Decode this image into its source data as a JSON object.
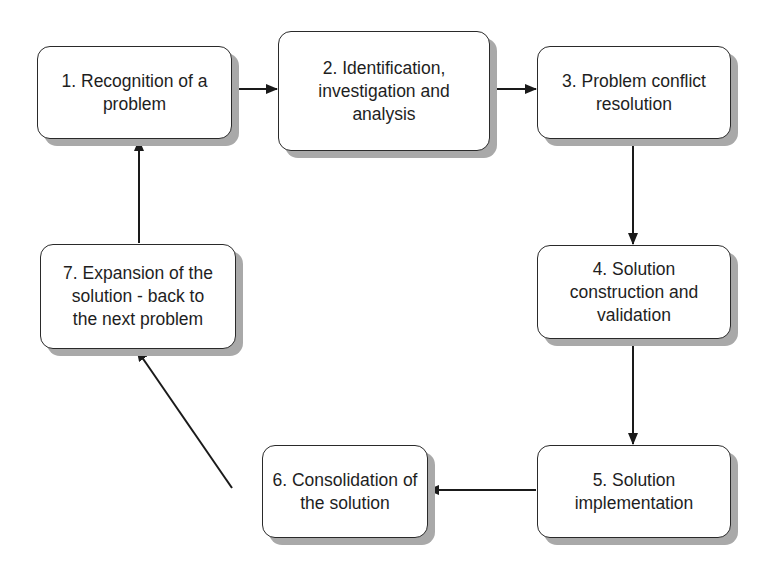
{
  "diagram": {
    "type": "cyclic-process-flowchart",
    "nodes": [
      {
        "id": 1,
        "label": "1. Recognition of a\nproblem"
      },
      {
        "id": 2,
        "label": "2. Identification,\ninvestigation and\nanalysis"
      },
      {
        "id": 3,
        "label": "3. Problem conflict\nresolution"
      },
      {
        "id": 4,
        "label": "4. Solution\nconstruction and\nvalidation"
      },
      {
        "id": 5,
        "label": "5. Solution\nimplementation"
      },
      {
        "id": 6,
        "label": "6. Consolidation of\nthe solution"
      },
      {
        "id": 7,
        "label": "7. Expansion of the\nsolution - back to\nthe next problem"
      }
    ],
    "edges": [
      {
        "from": 1,
        "to": 2
      },
      {
        "from": 2,
        "to": 3
      },
      {
        "from": 3,
        "to": 4
      },
      {
        "from": 4,
        "to": 5
      },
      {
        "from": 5,
        "to": 6
      },
      {
        "from": 6,
        "to": 7
      },
      {
        "from": 7,
        "to": 1
      }
    ],
    "colors": {
      "box_border": "#2a2a2a",
      "box_fill": "#ffffff",
      "shadow": "#a9a9a9",
      "arrow": "#1a1a1a",
      "text": "#1e1e1e"
    }
  }
}
